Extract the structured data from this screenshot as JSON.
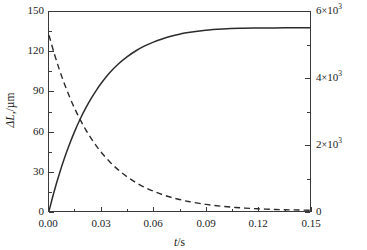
{
  "chart_data": {
    "type": "line",
    "title": "",
    "xlabel": "t/s",
    "ylabel_left": "ΔL,/μm",
    "ylabel_right": "V,/(μm/s)",
    "grid": false,
    "legend": "none",
    "xlim": [
      0,
      0.15
    ],
    "ylim_left": [
      0,
      150
    ],
    "ylim_right": [
      0,
      6000
    ],
    "x_ticks": [
      "0.00",
      "0.03",
      "0.06",
      "0.09",
      "0.12",
      "0.15"
    ],
    "x_tick_values": [
      0.0,
      0.03,
      0.06,
      0.09,
      0.12,
      0.15
    ],
    "y_left_ticks": [
      "0",
      "30",
      "60",
      "90",
      "120",
      "150"
    ],
    "y_left_tick_values": [
      0,
      30,
      60,
      90,
      120,
      150
    ],
    "y_right_ticks": [
      "0",
      "2×10³",
      "4×10³",
      "6×10³"
    ],
    "y_right_tick_values": [
      0,
      2000,
      4000,
      6000
    ],
    "x": [
      0.0,
      0.003,
      0.006,
      0.009,
      0.012,
      0.015,
      0.018,
      0.021,
      0.024,
      0.027,
      0.03,
      0.035,
      0.04,
      0.045,
      0.05,
      0.055,
      0.06,
      0.065,
      0.07,
      0.075,
      0.08,
      0.09,
      0.1,
      0.11,
      0.12,
      0.13,
      0.14,
      0.15
    ],
    "series": [
      {
        "name": "ΔL",
        "axis": "left",
        "style": "solid",
        "color": "#2b2b2b",
        "units": "µm",
        "values": [
          0,
          14.9,
          28.3,
          40.3,
          51.1,
          60.8,
          69.5,
          77.3,
          84.3,
          90.6,
          96.3,
          104.4,
          111.0,
          116.4,
          120.8,
          124.4,
          127.3,
          129.7,
          131.7,
          133.3,
          134.6,
          136.3,
          137.2,
          137.7,
          137.9,
          138.0,
          138.1,
          138.1
        ]
      },
      {
        "name": "V",
        "axis": "right",
        "style": "dashed",
        "color": "#2b2b2b",
        "units": "µm/s",
        "values": [
          5300,
          4750,
          4257,
          3815,
          3419,
          3064,
          2746,
          2461,
          2205,
          1976,
          1771,
          1477,
          1232,
          1027,
          857,
          714,
          596,
          497,
          414,
          346,
          288,
          200,
          140,
          97,
          67,
          47,
          33,
          23
        ]
      }
    ]
  }
}
